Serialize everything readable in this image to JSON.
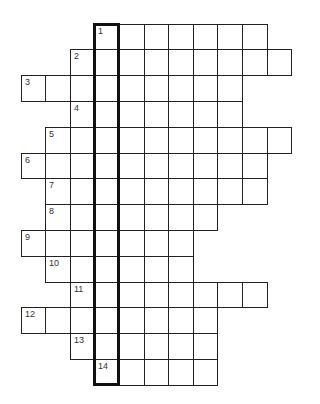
{
  "puzzle": {
    "type": "crossword-grid",
    "origin_x": 20.5,
    "origin_y": 23.5,
    "cell_width": 24.6,
    "cell_height": 25.8,
    "highlight_column": 3,
    "rows": [
      {
        "number": "1",
        "start_col": 3,
        "end_col": 9
      },
      {
        "number": "2",
        "start_col": 2,
        "end_col": 10
      },
      {
        "number": "3",
        "start_col": 0,
        "end_col": 8
      },
      {
        "number": "4",
        "start_col": 2,
        "end_col": 8
      },
      {
        "number": "5",
        "start_col": 1,
        "end_col": 10
      },
      {
        "number": "6",
        "start_col": 0,
        "end_col": 9
      },
      {
        "number": "7",
        "start_col": 1,
        "end_col": 9
      },
      {
        "number": "8",
        "start_col": 1,
        "end_col": 7
      },
      {
        "number": "9",
        "start_col": 0,
        "end_col": 6
      },
      {
        "number": "10",
        "start_col": 1,
        "end_col": 6
      },
      {
        "number": "11",
        "start_col": 2,
        "end_col": 9
      },
      {
        "number": "12",
        "start_col": 0,
        "end_col": 7
      },
      {
        "number": "13",
        "start_col": 2,
        "end_col": 7
      },
      {
        "number": "14",
        "start_col": 3,
        "end_col": 7
      }
    ]
  }
}
